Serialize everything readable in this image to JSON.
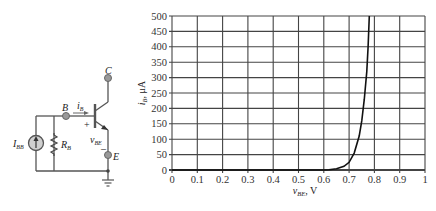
{
  "circuit": {
    "labels": {
      "collector": "C",
      "base": "B",
      "emitter": "E",
      "base_current": "i",
      "base_current_sub": "B",
      "source": "I",
      "source_sub": "BB",
      "resistor": "R",
      "resistor_sub": "B",
      "vbe": "v",
      "vbe_sub": "BE",
      "plus": "+",
      "minus": "–"
    }
  },
  "chart_data": {
    "type": "line",
    "title": "",
    "xlabel": "vBE, V",
    "ylabel": "iB, μA",
    "xlim": [
      0,
      1
    ],
    "ylim": [
      0,
      500
    ],
    "grid": true,
    "legend": "none",
    "x_ticks": [
      "0",
      "0.1",
      "0.2",
      "0.3",
      "0.4",
      "0.5",
      "0.6",
      "0.7",
      "0.8",
      "0.9",
      "1"
    ],
    "y_ticks": [
      "0",
      "50",
      "100",
      "150",
      "200",
      "250",
      "300",
      "350",
      "400",
      "450",
      "500"
    ],
    "series": [
      {
        "name": "iB vs vBE",
        "x": [
          0.0,
          0.5,
          0.6,
          0.62,
          0.65,
          0.68,
          0.7,
          0.72,
          0.74,
          0.75,
          0.76,
          0.77,
          0.775,
          0.78
        ],
        "y": [
          0,
          0,
          0,
          1,
          4,
          12,
          25,
          55,
          110,
          160,
          230,
          320,
          400,
          500
        ]
      }
    ]
  },
  "axis_labels": {
    "x_main": "v",
    "x_sub": "BE",
    "x_unit": ", V",
    "y_main": "i",
    "y_sub": "B",
    "y_unit": ", μA"
  }
}
